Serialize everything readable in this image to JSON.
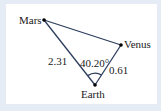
{
  "diagram": {
    "type": "triangle",
    "points": {
      "mars": {
        "label": "Mars",
        "x": 44,
        "y": 20
      },
      "venus": {
        "label": "Venus",
        "x": 121,
        "y": 45
      },
      "earth": {
        "label": "Earth",
        "x": 95,
        "y": 85
      }
    },
    "edges": {
      "earth_mars": {
        "label": "2.31"
      },
      "earth_venus": {
        "label": "0.61"
      },
      "mars_venus": {
        "label": ""
      }
    },
    "angle": {
      "vertex": "Earth",
      "label": "40.20°"
    },
    "colors": {
      "line": "#2c3e5c",
      "dot": "#000000",
      "background": "#ffffff",
      "frame": "#e6ecf5"
    }
  }
}
